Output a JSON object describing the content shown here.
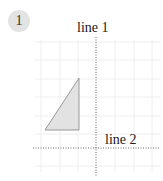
{
  "badge": {
    "number": "1"
  },
  "diagram": {
    "line1_label": "line 1",
    "line2_label": "line 2",
    "grid_color": "#eeeeee",
    "line_color": "#666666",
    "triangle_fill": "#e2e2e2",
    "triangle_stroke": "#999999",
    "triangle": {
      "vertices": [
        [
          45,
          130
        ],
        [
          79,
          78
        ],
        [
          79,
          130
        ]
      ]
    },
    "line1": {
      "x": 96,
      "y1": 37,
      "y2": 176
    },
    "line2": {
      "y": 148,
      "x1": 33,
      "x2": 160
    }
  }
}
